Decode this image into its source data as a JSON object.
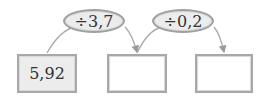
{
  "diagram": {
    "start_value": "5,92",
    "operations": [
      {
        "label": "÷3,7"
      },
      {
        "label": "÷0,2"
      }
    ],
    "boxes": [
      {
        "value": "5,92",
        "filled": true
      },
      {
        "value": "",
        "filled": false
      },
      {
        "value": "",
        "filled": false
      }
    ],
    "colors": {
      "stroke": "#a8a8a8",
      "fill": "#ececec",
      "text": "#333333"
    }
  }
}
